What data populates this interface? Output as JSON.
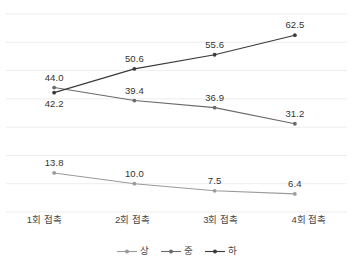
{
  "chart_data": {
    "type": "line",
    "title": "",
    "subtitle": "",
    "xlabel": "",
    "ylabel": "",
    "grid": true,
    "gridlines": [
      0,
      10,
      20,
      30,
      40,
      50,
      60,
      70
    ],
    "ylim": [
      0,
      70
    ],
    "legend_position": "bottom-center",
    "categories": [
      "1회 접촉",
      "2회 접촉",
      "3회 접촉",
      "4회 접촉"
    ],
    "series": [
      {
        "name": "상",
        "color": "#9a9a9a",
        "values": [
          13.8,
          10.0,
          7.5,
          6.4
        ],
        "labels": [
          "13.8",
          "10.0",
          "7.5",
          "6.4"
        ]
      },
      {
        "name": "중",
        "color": "#6a6a6a",
        "values": [
          44.0,
          39.4,
          36.9,
          31.2
        ],
        "labels": [
          "44.0",
          "39.4",
          "36.9",
          "31.2"
        ]
      },
      {
        "name": "하",
        "color": "#3a3a3a",
        "values": [
          42.2,
          50.6,
          55.6,
          62.5
        ],
        "labels": [
          "42.2",
          "50.6",
          "55.6",
          "62.5"
        ]
      }
    ]
  },
  "axis": {
    "ticks": [
      "1회 접촉",
      "2회 접촉",
      "3회 접촉",
      "4회 접촉"
    ]
  },
  "legend": {
    "items": [
      {
        "label": "상",
        "color": "#9a9a9a"
      },
      {
        "label": "중",
        "color": "#6a6a6a"
      },
      {
        "label": "하",
        "color": "#3a3a3a"
      }
    ]
  },
  "colors": {
    "grid": "#ededed",
    "text": "#3b3b3b",
    "background": "#ffffff"
  }
}
